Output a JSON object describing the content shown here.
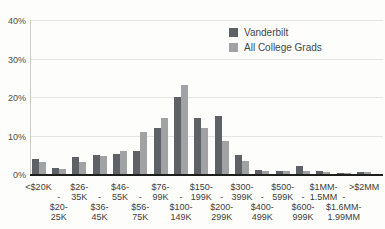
{
  "chart_data": {
    "type": "bar",
    "title": "",
    "xlabel": "",
    "ylabel": "",
    "ylim": [
      0,
      40
    ],
    "grid": true,
    "legend_position": "top-right",
    "y_tick_labels": [
      "0%",
      "10%",
      "20%",
      "30%",
      "40%"
    ],
    "y_tick_values": [
      0,
      10,
      20,
      30,
      40
    ],
    "tick_dash": "-",
    "categories": [
      "<$20K",
      "$20-25K",
      "$26-35K",
      "$36-45K",
      "$46-55K",
      "$56-75K",
      "$76-99K",
      "$100-149K",
      "$150-199K",
      "$200-299K",
      "$300-399K",
      "$400-499K",
      "$500-599K",
      "$600-999K",
      "$1MM-1.5MM",
      "$1.6MM-1.99MM",
      ">$2MM"
    ],
    "category_lines": [
      [
        "<$20K"
      ],
      [
        "$20-",
        "25K"
      ],
      [
        "$26-",
        "35K"
      ],
      [
        "$36-",
        "45K"
      ],
      [
        "$46-",
        "55K"
      ],
      [
        "$56-",
        "75K"
      ],
      [
        "$76-",
        "99K"
      ],
      [
        "$100-",
        "149K"
      ],
      [
        "$150-",
        "199K"
      ],
      [
        "$200-",
        "299K"
      ],
      [
        "$300-",
        "399K"
      ],
      [
        "$400-",
        "499K"
      ],
      [
        "$500-",
        "599K"
      ],
      [
        "$600-",
        "999K"
      ],
      [
        "$1MM-",
        "1.5MM"
      ],
      [
        "$1.6MM-",
        "1.99MM"
      ],
      [
        ">$2MM"
      ]
    ],
    "series": [
      {
        "name": "Vanderbilt",
        "color": "#5e6165",
        "values": [
          4,
          1.5,
          4.5,
          5,
          5.2,
          6,
          12,
          20,
          14.5,
          15,
          5,
          1,
          0.9,
          2,
          0.8,
          0.2,
          0.5
        ]
      },
      {
        "name": "All College Grads",
        "color": "#a0a2a4",
        "values": [
          3,
          1.4,
          3,
          4.6,
          6,
          11,
          14.5,
          23,
          12,
          8.5,
          3.5,
          0.8,
          0.7,
          0.9,
          0.4,
          0.1,
          0.4
        ]
      }
    ]
  }
}
